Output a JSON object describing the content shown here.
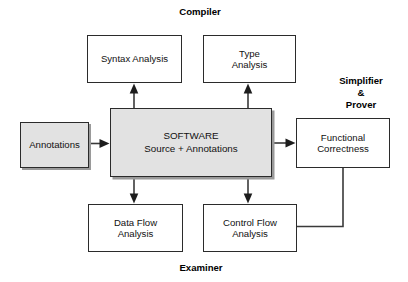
{
  "diagram": {
    "title_hidden": "SPARK toolset dataflow diagram",
    "background_color": "#ffffff",
    "line_color": "#3a3a3a",
    "shaded_fill": "#e2e2e2",
    "shadow_color": "#9a9a9a",
    "nodes": [
      {
        "id": "syntax-analysis",
        "label": "Syntax Analysis",
        "shaded": false,
        "x": 87,
        "y": 35,
        "w": 95,
        "h": 48
      },
      {
        "id": "type-analysis",
        "label": "Type\nAnalysis",
        "shaded": false,
        "x": 203,
        "y": 35,
        "w": 93,
        "h": 48
      },
      {
        "id": "annotations",
        "label": "Annotations",
        "shaded": true,
        "x": 20,
        "y": 122,
        "w": 69,
        "h": 46
      },
      {
        "id": "software",
        "label": "SOFTWARE\nSource + Annotations",
        "shaded": true,
        "x": 110,
        "y": 108,
        "w": 162,
        "h": 69
      },
      {
        "id": "functional-correctness",
        "label": "Functional\nCorrectness",
        "shaded": false,
        "x": 296,
        "y": 118,
        "w": 94,
        "h": 50
      },
      {
        "id": "data-flow-analysis",
        "label": "Data Flow\nAnalysis",
        "shaded": false,
        "x": 88,
        "y": 204,
        "w": 95,
        "h": 48
      },
      {
        "id": "control-flow-analysis",
        "label": "Control Flow\nAnalysis",
        "shaded": false,
        "x": 203,
        "y": 204,
        "w": 94,
        "h": 48
      }
    ],
    "group_labels": [
      {
        "id": "compiler",
        "label": "Compiler",
        "x": 168,
        "y": 6,
        "w": 64,
        "align": "center"
      },
      {
        "id": "simplifier-prover",
        "label": "Simplifier\n&\nProver",
        "x": 330,
        "y": 75,
        "w": 62,
        "align": "center"
      },
      {
        "id": "examiner",
        "label": "Examiner",
        "x": 169,
        "y": 262,
        "w": 64,
        "align": "center"
      }
    ],
    "connectors": [
      {
        "id": "software-to-syntax-analysis",
        "from": "software",
        "to": "syntax-analysis",
        "kind": "arrow",
        "direction": "up"
      },
      {
        "id": "software-to-type-analysis",
        "from": "software",
        "to": "type-analysis",
        "kind": "arrow",
        "direction": "up"
      },
      {
        "id": "annotations-to-software",
        "from": "annotations",
        "to": "software",
        "kind": "arrow",
        "direction": "right"
      },
      {
        "id": "software-to-functional-correctness",
        "from": "software",
        "to": "functional-correctness",
        "kind": "arrow",
        "direction": "right"
      },
      {
        "id": "software-to-data-flow-analysis",
        "from": "software",
        "to": "data-flow-analysis",
        "kind": "arrow",
        "direction": "down"
      },
      {
        "id": "software-to-control-flow-analysis",
        "from": "software",
        "to": "control-flow-analysis",
        "kind": "arrow",
        "direction": "down"
      },
      {
        "id": "functional-correctness-to-control-flow-analysis",
        "from": "functional-correctness",
        "to": "control-flow-analysis",
        "kind": "line",
        "direction": "elbow"
      }
    ]
  }
}
